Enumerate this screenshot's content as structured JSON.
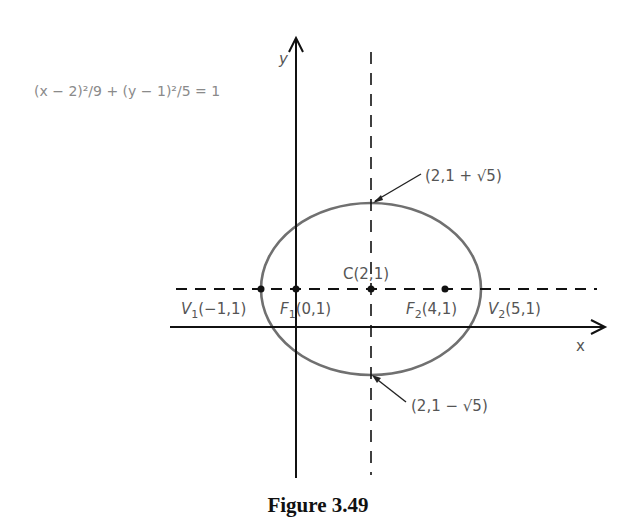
{
  "figure": {
    "caption": "Figure 3.49",
    "equation": "(x − 2)²/9 + (y − 1)²/5 = 1",
    "axis_labels": {
      "x": "x",
      "y": "y"
    },
    "points": {
      "center": {
        "label": "C(2,1)"
      },
      "v1": {
        "name": "V",
        "sub": "1",
        "coords": "(−1,1)"
      },
      "f1": {
        "name": "F",
        "sub": "1",
        "coords": "(0,1)"
      },
      "f2": {
        "name": "F",
        "sub": "2",
        "coords": "(4,1)"
      },
      "v2": {
        "name": "V",
        "sub": "2",
        "coords": "(5,1)"
      },
      "top": {
        "label": "(2,1 + √5)"
      },
      "bottom": {
        "label": "(2,1 − √5)"
      }
    }
  },
  "colors": {
    "axis": "#111111",
    "ellipse": "#6e6e6e",
    "text": "#555555"
  }
}
